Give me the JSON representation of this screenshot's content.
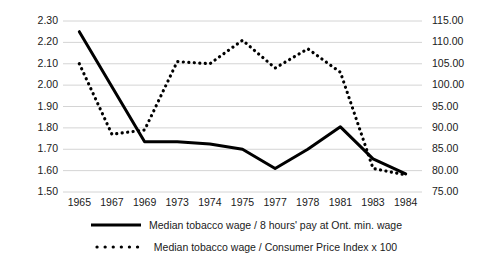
{
  "chart_data": {
    "type": "line",
    "title": "",
    "subtitle": "",
    "xlabel": "",
    "ylabel": "",
    "y2label": "",
    "grid": true,
    "legend_position": "bottom",
    "categories": [
      "1965",
      "1967",
      "1969",
      "1973",
      "1974",
      "1975",
      "1977",
      "1978",
      "1981",
      "1983",
      "1984"
    ],
    "y_left_ticks": [
      "1.50",
      "1.60",
      "1.70",
      "1.80",
      "1.90",
      "2.00",
      "2.10",
      "2.20",
      "2.30"
    ],
    "y_right_ticks": [
      "75.00",
      "80.00",
      "85.00",
      "90.00",
      "95.00",
      "100.00",
      "105.00",
      "110.00",
      "115.00"
    ],
    "ylim": [
      1.5,
      2.3
    ],
    "y2lim": [
      75.0,
      115.0
    ],
    "series": [
      {
        "name": "Median tobacco wage / 8 hours' pay at Ont. min. wage",
        "style": "solid",
        "axis": "left",
        "color": "#000000",
        "values": [
          2.25,
          null,
          1.735,
          1.735,
          1.725,
          1.7,
          1.61,
          1.7,
          1.805,
          1.655,
          1.585
        ]
      },
      {
        "name": "Median tobacco wage / Consumer Price Index x 100",
        "style": "dotted",
        "axis": "right",
        "color": "#000000",
        "values": [
          105.0,
          88.5,
          89.5,
          105.5,
          105.0,
          110.5,
          104.0,
          108.5,
          103.0,
          80.5,
          79.0
        ]
      }
    ]
  },
  "legend": {
    "items": [
      {
        "label": "Median tobacco wage / 8 hours' pay at Ont. min. wage",
        "style": "solid"
      },
      {
        "label": "Median tobacco wage / Consumer Price Index x 100",
        "style": "dotted"
      }
    ]
  }
}
